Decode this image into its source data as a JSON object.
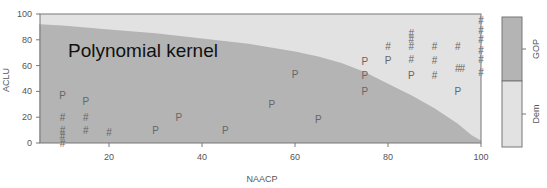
{
  "chart_data": {
    "type": "scatter",
    "title": "",
    "annotation": "Polynomial kernel",
    "xlabel": "NAACP",
    "ylabel": "ACLU",
    "xlim": [
      5,
      100
    ],
    "ylim": [
      0,
      100
    ],
    "x_ticks": [
      20,
      40,
      60,
      80,
      100
    ],
    "y_ticks": [
      0,
      20,
      40,
      60,
      80,
      100
    ],
    "grid": false,
    "legend": {
      "position": "right",
      "entries": [
        {
          "label": "GOP",
          "color": "#b4b4b4"
        },
        {
          "label": "Dem",
          "color": "#e2e2e2"
        }
      ]
    },
    "regions": {
      "GOP_color": "#b4b4b4",
      "Dem_color": "#e2e2e2",
      "boundary": [
        [
          5,
          92
        ],
        [
          10,
          91
        ],
        [
          20,
          88
        ],
        [
          30,
          85
        ],
        [
          40,
          81
        ],
        [
          50,
          77
        ],
        [
          60,
          71
        ],
        [
          65,
          67
        ],
        [
          70,
          62
        ],
        [
          75,
          55
        ],
        [
          80,
          46
        ],
        [
          85,
          37
        ],
        [
          90,
          27
        ],
        [
          95,
          15
        ],
        [
          98,
          6
        ],
        [
          100,
          2
        ]
      ]
    },
    "series": [
      {
        "name": "P",
        "marker": "P",
        "points": [
          [
            10,
            37
          ],
          [
            15,
            32
          ],
          [
            30,
            10
          ],
          [
            35,
            20
          ],
          [
            45,
            10
          ],
          [
            55,
            30
          ],
          [
            60,
            53
          ],
          [
            65,
            18
          ],
          [
            75,
            63
          ],
          [
            75,
            52
          ],
          [
            75,
            40
          ],
          [
            80,
            64
          ],
          [
            85,
            52
          ],
          [
            95,
            40
          ]
        ]
      },
      {
        "name": "#",
        "marker": "#",
        "points": [
          [
            10,
            20
          ],
          [
            10,
            10
          ],
          [
            10,
            5
          ],
          [
            10,
            0
          ],
          [
            15,
            20
          ],
          [
            15,
            10
          ],
          [
            20,
            8
          ],
          [
            80,
            75
          ],
          [
            85,
            85
          ],
          [
            85,
            80
          ],
          [
            85,
            75
          ],
          [
            85,
            65
          ],
          [
            90,
            75
          ],
          [
            90,
            64
          ],
          [
            90,
            52
          ],
          [
            95,
            75
          ],
          [
            95,
            58
          ],
          [
            96,
            58
          ],
          [
            100,
            95
          ],
          [
            100,
            87
          ],
          [
            100,
            80
          ],
          [
            100,
            72
          ],
          [
            100,
            65
          ],
          [
            100,
            55
          ]
        ]
      }
    ]
  }
}
